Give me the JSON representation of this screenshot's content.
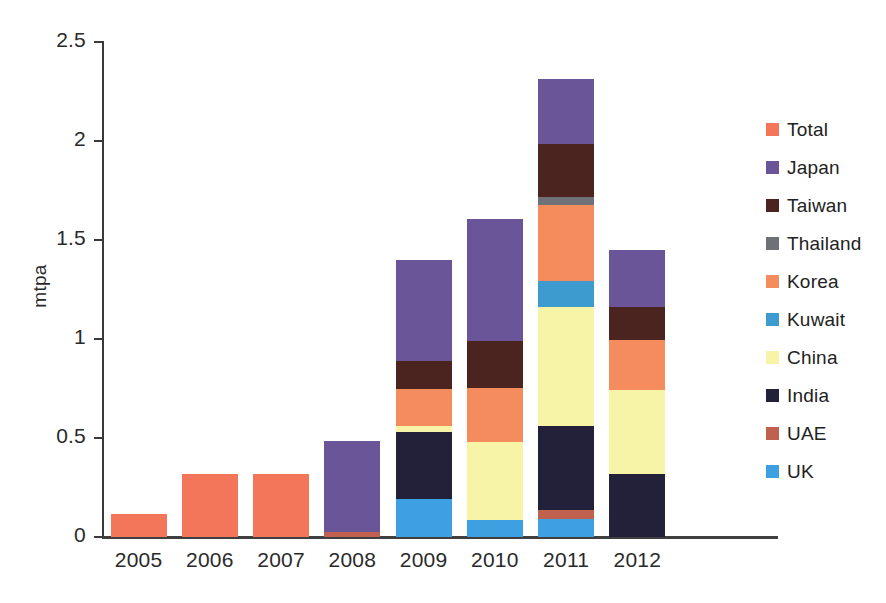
{
  "chart_data": {
    "type": "bar",
    "stacked": true,
    "title": "",
    "xlabel": "",
    "ylabel": "mtpa",
    "ylim": [
      0,
      2.5
    ],
    "yticks": [
      0,
      0.5,
      1,
      1.5,
      2,
      2.5
    ],
    "ytick_labels": [
      "0",
      "0.5",
      "1",
      "1.5",
      "2",
      "2.5"
    ],
    "grid": false,
    "legend_position": "right",
    "categories": [
      "2005",
      "2006",
      "2007",
      "2008",
      "2009",
      "2010",
      "2011",
      "2012"
    ],
    "series": [
      {
        "name": "Total",
        "color": "#F4765A",
        "values": [
          0.115,
          0.32,
          0.32,
          0,
          0,
          0,
          0,
          0
        ]
      },
      {
        "name": "Japan",
        "color": "#6A5599",
        "values": [
          0,
          0,
          0,
          0.46,
          0.51,
          0.615,
          0.33,
          0.29
        ]
      },
      {
        "name": "Taiwan",
        "color": "#4B2420",
        "values": [
          0,
          0,
          0,
          0,
          0.14,
          0.235,
          0.27,
          0.165
        ]
      },
      {
        "name": "Thailand",
        "color": "#6E7175",
        "values": [
          0,
          0,
          0,
          0,
          0,
          0,
          0.04,
          0
        ]
      },
      {
        "name": "Korea",
        "color": "#F58C5D",
        "values": [
          0,
          0,
          0,
          0,
          0.19,
          0.275,
          0.38,
          0.25
        ]
      },
      {
        "name": "Kuwait",
        "color": "#3E9BD0",
        "values": [
          0,
          0,
          0,
          0,
          0,
          0,
          0.135,
          0
        ]
      },
      {
        "name": "China",
        "color": "#F7F4A8",
        "values": [
          0,
          0,
          0,
          0,
          0.03,
          0.395,
          0.6,
          0.425
        ]
      },
      {
        "name": "India",
        "color": "#232139",
        "values": [
          0,
          0,
          0,
          0,
          0.34,
          0,
          0.425,
          0.32
        ]
      },
      {
        "name": "UAE",
        "color": "#C0604F",
        "values": [
          0,
          0,
          0,
          0.025,
          0,
          0,
          0.045,
          0
        ]
      },
      {
        "name": "UK",
        "color": "#3EA0E0",
        "values": [
          0,
          0,
          0,
          0,
          0.19,
          0.085,
          0.09,
          0
        ]
      }
    ],
    "stack_order_bottom_to_top": [
      "UK",
      "UAE",
      "India",
      "China",
      "Kuwait",
      "Korea",
      "Thailand",
      "Taiwan",
      "Japan",
      "Total"
    ],
    "totals": [
      0.115,
      0.32,
      0.32,
      0.485,
      1.4,
      1.86,
      2.31,
      1.45
    ]
  },
  "legend": {
    "items": [
      {
        "label": "Total",
        "color": "#F4765A"
      },
      {
        "label": "Japan",
        "color": "#6A5599"
      },
      {
        "label": "Taiwan",
        "color": "#4B2420"
      },
      {
        "label": "Thailand",
        "color": "#6E7175"
      },
      {
        "label": "Korea",
        "color": "#F58C5D"
      },
      {
        "label": "Kuwait",
        "color": "#3E9BD0"
      },
      {
        "label": "China",
        "color": "#F7F4A8"
      },
      {
        "label": "India",
        "color": "#232139"
      },
      {
        "label": "UAE",
        "color": "#C0604F"
      },
      {
        "label": "UK",
        "color": "#3EA0E0"
      }
    ]
  },
  "axes": {
    "y_title": "mtpa"
  }
}
